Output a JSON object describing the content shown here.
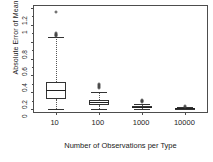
{
  "chart_data": {
    "type": "box",
    "title": "",
    "xlabel": "Number of Observations per Type",
    "ylabel": "Absolute Error of Mean Value",
    "categories": [
      "10",
      "100",
      "1000",
      "10000"
    ],
    "ylim": [
      0,
      1.2
    ],
    "yticks": [
      0,
      0.2,
      0.4,
      0.6,
      0.8,
      1,
      1.2
    ],
    "ytick_labels": [
      "0",
      "0.2",
      "0.4",
      "0.6",
      "0.8",
      "1",
      "1.2"
    ],
    "grid": false,
    "legend": "none",
    "boxes": [
      {
        "category": "10",
        "whisker_low": 0.005,
        "q1": 0.115,
        "median": 0.225,
        "q3": 0.325,
        "whisker_high": 0.855,
        "outliers": [
          0.865,
          0.875,
          0.885,
          0.895,
          0.905,
          1.155
        ]
      },
      {
        "category": "100",
        "whisker_low": 0.005,
        "q1": 0.045,
        "median": 0.08,
        "q3": 0.11,
        "whisker_high": 0.205,
        "outliers": [
          0.255,
          0.265,
          0.275,
          0.285,
          0.295
        ]
      },
      {
        "category": "1000",
        "whisker_low": 0.002,
        "q1": 0.015,
        "median": 0.026,
        "q3": 0.037,
        "whisker_high": 0.065,
        "outliers": [
          0.08,
          0.09,
          0.1,
          0.108
        ]
      },
      {
        "category": "10000",
        "whisker_low": 0.001,
        "q1": 0.005,
        "median": 0.009,
        "q3": 0.013,
        "whisker_high": 0.022,
        "outliers": [
          0.028,
          0.032
        ]
      }
    ]
  },
  "colors": {
    "axis": "#4d4d4d",
    "box_stroke": "#333333",
    "median": "#222222",
    "whisker": "#555555",
    "text": "#222222",
    "background": "#ffffff"
  }
}
